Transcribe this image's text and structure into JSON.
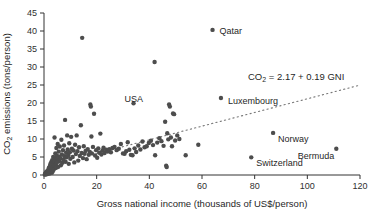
{
  "chart_data": {
    "type": "scatter",
    "title": "",
    "xlabel": "Gross national income (thousands of US$/person)",
    "ylabel_parts": {
      "pre": "CO",
      "sub": "2",
      "post": " emissions (tons/person)"
    },
    "ylabel": "CO2 emissions (tons/person)",
    "xlim": [
      0,
      120
    ],
    "ylim": [
      0,
      45
    ],
    "xticks": [
      0,
      20,
      40,
      60,
      80,
      100,
      120
    ],
    "yticks": [
      0,
      5,
      10,
      15,
      20,
      25,
      30,
      35,
      40,
      45
    ],
    "grid": false,
    "legend": "none",
    "marker_color": "#4d4d4d",
    "marker_size_px": 4.4,
    "axis_color": "#333333",
    "trendline": {
      "style": "dotted",
      "color": "#777777",
      "equation_parts": {
        "pre": "CO",
        "sub": "2",
        "post": " = 2.17 + 0.19 GNI"
      },
      "equation": "CO2 = 2.17 + 0.19 GNI",
      "intercept": 2.17,
      "slope": 0.19,
      "x_start": 20,
      "x_end": 120
    },
    "annotations": [
      {
        "label": "Qatar",
        "x": 64.0,
        "y": 40.3,
        "dx": 7,
        "dy": 4
      },
      {
        "label": "USA",
        "x": 47.5,
        "y": 19.6,
        "dx": -26,
        "dy": -2
      },
      {
        "label": "Luxembourg",
        "x": 67.2,
        "y": 21.4,
        "dx": 7,
        "dy": 6
      },
      {
        "label": "Norway",
        "x": 87.0,
        "y": 11.7,
        "dx": 5,
        "dy": 9
      },
      {
        "label": "Switzerland",
        "x": 78.7,
        "y": 4.9,
        "dx": 5,
        "dy": 9
      },
      {
        "label": "Bermuda",
        "x": 111.0,
        "y": 7.3,
        "dx": -2,
        "dy": 10
      }
    ],
    "points": [
      [
        0.3,
        0.1
      ],
      [
        0.4,
        0.3
      ],
      [
        0.5,
        0.2
      ],
      [
        0.6,
        0.5
      ],
      [
        0.7,
        0.3
      ],
      [
        0.8,
        0.8
      ],
      [
        0.9,
        0.4
      ],
      [
        1.0,
        0.2
      ],
      [
        1.1,
        1.0
      ],
      [
        1.2,
        0.6
      ],
      [
        1.3,
        0.3
      ],
      [
        1.4,
        1.2
      ],
      [
        1.5,
        0.5
      ],
      [
        1.6,
        0.9
      ],
      [
        1.7,
        1.6
      ],
      [
        1.8,
        0.7
      ],
      [
        1.9,
        2.0
      ],
      [
        2.0,
        1.1
      ],
      [
        2.1,
        0.4
      ],
      [
        2.2,
        2.4
      ],
      [
        2.3,
        1.3
      ],
      [
        2.4,
        3.0
      ],
      [
        2.5,
        0.9
      ],
      [
        2.6,
        1.8
      ],
      [
        2.7,
        3.5
      ],
      [
        2.8,
        1.4
      ],
      [
        2.9,
        2.6
      ],
      [
        3.0,
        0.6
      ],
      [
        3.1,
        4.1
      ],
      [
        3.2,
        2.2
      ],
      [
        3.3,
        1.0
      ],
      [
        3.4,
        3.3
      ],
      [
        3.5,
        5.0
      ],
      [
        3.6,
        2.0
      ],
      [
        3.7,
        1.5
      ],
      [
        3.8,
        4.4
      ],
      [
        3.9,
        2.8
      ],
      [
        4.0,
        10.4
      ],
      [
        4.1,
        3.8
      ],
      [
        4.2,
        1.9
      ],
      [
        4.3,
        6.0
      ],
      [
        4.4,
        2.5
      ],
      [
        4.5,
        4.8
      ],
      [
        4.6,
        3.2
      ],
      [
        4.7,
        7.5
      ],
      [
        4.8,
        2.1
      ],
      [
        4.9,
        5.4
      ],
      [
        5.0,
        3.6
      ],
      [
        5.2,
        8.6
      ],
      [
        5.3,
        4.2
      ],
      [
        5.4,
        2.3
      ],
      [
        5.6,
        6.5
      ],
      [
        5.8,
        3.9
      ],
      [
        5.9,
        5.1
      ],
      [
        6.0,
        7.9
      ],
      [
        6.2,
        4.6
      ],
      [
        6.4,
        2.7
      ],
      [
        6.6,
        9.8
      ],
      [
        6.8,
        5.7
      ],
      [
        7.0,
        3.4
      ],
      [
        7.2,
        6.9
      ],
      [
        7.4,
        4.3
      ],
      [
        7.6,
        8.2
      ],
      [
        7.8,
        5.2
      ],
      [
        8.0,
        15.3
      ],
      [
        8.2,
        3.7
      ],
      [
        8.4,
        6.2
      ],
      [
        8.6,
        4.9
      ],
      [
        8.8,
        11.0
      ],
      [
        9.0,
        7.1
      ],
      [
        9.2,
        5.5
      ],
      [
        9.4,
        3.1
      ],
      [
        9.6,
        8.8
      ],
      [
        9.8,
        6.3
      ],
      [
        10.0,
        4.5
      ],
      [
        10.3,
        10.6
      ],
      [
        10.6,
        7.3
      ],
      [
        10.9,
        5.0
      ],
      [
        11.2,
        6.8
      ],
      [
        11.5,
        3.5
      ],
      [
        11.8,
        8.4
      ],
      [
        12.1,
        5.8
      ],
      [
        12.4,
        11.0
      ],
      [
        12.7,
        6.6
      ],
      [
        13.0,
        4.0
      ],
      [
        13.3,
        7.7
      ],
      [
        13.6,
        5.3
      ],
      [
        14.0,
        13.8
      ],
      [
        14.3,
        6.1
      ],
      [
        14.5,
        38.1
      ],
      [
        14.8,
        4.7
      ],
      [
        15.1,
        8.0
      ],
      [
        15.4,
        5.9
      ],
      [
        15.8,
        6.7
      ],
      [
        16.2,
        4.4
      ],
      [
        16.6,
        7.2
      ],
      [
        17.0,
        5.6
      ],
      [
        17.4,
        6.4
      ],
      [
        17.6,
        19.6
      ],
      [
        17.8,
        19.0
      ],
      [
        18.0,
        10.7
      ],
      [
        18.2,
        6.0
      ],
      [
        18.6,
        7.8
      ],
      [
        19.0,
        17.0
      ],
      [
        19.4,
        5.4
      ],
      [
        19.8,
        6.9
      ],
      [
        20.2,
        4.8
      ],
      [
        20.6,
        7.4
      ],
      [
        21.0,
        6.2
      ],
      [
        21.4,
        11.5
      ],
      [
        21.8,
        5.7
      ],
      [
        22.2,
        6.8
      ],
      [
        22.6,
        7.6
      ],
      [
        23.0,
        6.1
      ],
      [
        23.6,
        7.0
      ],
      [
        24.2,
        6.5
      ],
      [
        24.8,
        7.2
      ],
      [
        25.4,
        6.3
      ],
      [
        26.0,
        7.5
      ],
      [
        26.8,
        7.8
      ],
      [
        27.6,
        6.9
      ],
      [
        28.4,
        7.3
      ],
      [
        29.2,
        8.6
      ],
      [
        30.0,
        6.0
      ],
      [
        30.6,
        5.9
      ],
      [
        31.2,
        6.6
      ],
      [
        31.8,
        9.1
      ],
      [
        32.4,
        7.0
      ],
      [
        33.0,
        5.6
      ],
      [
        33.6,
        5.5
      ],
      [
        34.0,
        19.9
      ],
      [
        34.4,
        7.4
      ],
      [
        35.0,
        6.4
      ],
      [
        35.8,
        8.2
      ],
      [
        36.6,
        7.1
      ],
      [
        37.4,
        9.3
      ],
      [
        38.2,
        7.7
      ],
      [
        39.0,
        8.0
      ],
      [
        39.8,
        8.9
      ],
      [
        40.6,
        9.5
      ],
      [
        41.4,
        8.3
      ],
      [
        42.0,
        31.4
      ],
      [
        42.2,
        5.5
      ],
      [
        43.0,
        9.0
      ],
      [
        43.8,
        10.2
      ],
      [
        44.6,
        9.4
      ],
      [
        45.4,
        8.1
      ],
      [
        46.0,
        14.8
      ],
      [
        46.4,
        2.6
      ],
      [
        46.6,
        2.2
      ],
      [
        46.8,
        11.6
      ],
      [
        47.2,
        9.9
      ],
      [
        47.5,
        19.6
      ],
      [
        47.8,
        19.0
      ],
      [
        48.2,
        10.4
      ],
      [
        48.6,
        8.0
      ],
      [
        49.0,
        17.1
      ],
      [
        49.4,
        16.9
      ],
      [
        49.8,
        9.6
      ],
      [
        50.6,
        11.0
      ],
      [
        51.4,
        10.0
      ],
      [
        53.8,
        5.5
      ],
      [
        58.6,
        8.4
      ],
      [
        64.0,
        40.3
      ],
      [
        67.2,
        21.4
      ],
      [
        78.7,
        4.9
      ],
      [
        87.0,
        11.7
      ],
      [
        111.0,
        7.3
      ]
    ]
  }
}
